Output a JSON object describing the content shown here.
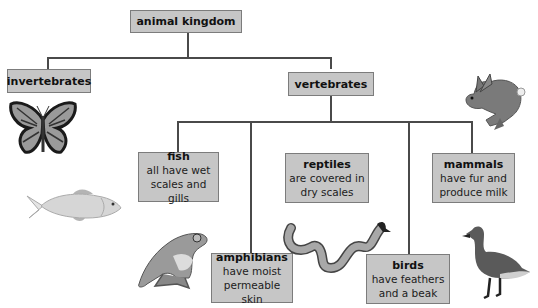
{
  "diagram": {
    "title": "animal kingdom",
    "nodes": [
      {
        "id": "animal-kingdom",
        "title": "animal kingdom",
        "desc": ""
      },
      {
        "id": "invertebrates",
        "title": "invertebrates",
        "desc": ""
      },
      {
        "id": "vertebrates",
        "title": "vertebrates",
        "desc": ""
      },
      {
        "id": "fish",
        "title": "fish",
        "desc_line1": "all have wet",
        "desc_line2": "scales and gills"
      },
      {
        "id": "reptiles",
        "title": "reptiles",
        "desc_line1": "are covered in",
        "desc_line2": "dry scales"
      },
      {
        "id": "mammals",
        "title": "mammals",
        "desc_line1": "have fur and",
        "desc_line2": "produce milk"
      },
      {
        "id": "amphibians",
        "title": "amphibians",
        "desc_line1": "have moist",
        "desc_line2": "permeable skin"
      },
      {
        "id": "birds",
        "title": "birds",
        "desc_line1": "have feathers",
        "desc_line2": "and a beak"
      }
    ],
    "edges": [
      [
        "animal-kingdom",
        "invertebrates"
      ],
      [
        "animal-kingdom",
        "vertebrates"
      ],
      [
        "vertebrates",
        "fish"
      ],
      [
        "vertebrates",
        "amphibians"
      ],
      [
        "vertebrates",
        "reptiles"
      ],
      [
        "vertebrates",
        "birds"
      ],
      [
        "vertebrates",
        "mammals"
      ]
    ],
    "illustrations": [
      "butterfly",
      "fish",
      "rabbit",
      "frog",
      "snake",
      "goose"
    ],
    "colors": {
      "box_fill": "#c6c6c6",
      "box_border": "#7c7c7c",
      "line": "#4a4a4a"
    }
  }
}
